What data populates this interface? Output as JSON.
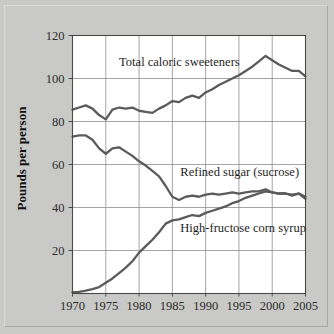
{
  "chart_data": {
    "type": "line",
    "title": "",
    "xlabel": "",
    "ylabel": "Pounds per person",
    "xlim": [
      1970,
      2005
    ],
    "ylim": [
      0,
      120
    ],
    "xticks": [
      1970,
      1975,
      1980,
      1985,
      1990,
      1995,
      2000,
      2005
    ],
    "xtick_labels": [
      "1970",
      "1975",
      "1980",
      "1985",
      "1990",
      "1995",
      "2000",
      "2005"
    ],
    "yticks": [
      20,
      40,
      60,
      80,
      100,
      120
    ],
    "ytick_labels": [
      "20",
      "40",
      "60",
      "80",
      "100",
      "120"
    ],
    "grid": true,
    "legend_position": "inline-annotations",
    "line_color": "#5b5b5b",
    "plot_background": "#ffffff",
    "figure_background": "#c9c9c7",
    "x": [
      1970,
      1971,
      1972,
      1973,
      1974,
      1975,
      1976,
      1977,
      1978,
      1979,
      1980,
      1981,
      1982,
      1983,
      1984,
      1985,
      1986,
      1987,
      1988,
      1989,
      1990,
      1991,
      1992,
      1993,
      1994,
      1995,
      1996,
      1997,
      1998,
      1999,
      2000,
      2001,
      2002,
      2003,
      2004,
      2005
    ],
    "series": [
      {
        "name": "Total caloric sweeteners",
        "label": "Total caloric sweeteners",
        "label_x": 1977.0,
        "label_y": 106.0,
        "values": [
          85.5,
          86.5,
          87.5,
          86.0,
          83.0,
          81.0,
          85.5,
          86.5,
          86.0,
          86.5,
          85.0,
          84.5,
          84.0,
          86.0,
          87.5,
          89.5,
          89.0,
          91.0,
          92.0,
          91.0,
          93.5,
          95.0,
          97.0,
          98.5,
          100.0,
          101.5,
          103.5,
          105.5,
          108.0,
          110.5,
          108.5,
          106.5,
          105.0,
          103.5,
          103.5,
          101.0
        ]
      },
      {
        "name": "Refined sugar (sucrose)",
        "label": "Refined sugar (sucrose)",
        "label_x": 1986.2,
        "label_y": 54.5,
        "values": [
          73.0,
          73.5,
          73.5,
          71.5,
          67.5,
          65.0,
          67.5,
          68.0,
          66.0,
          64.0,
          61.5,
          59.5,
          57.0,
          54.5,
          50.0,
          45.0,
          43.5,
          45.0,
          45.5,
          45.0,
          46.0,
          46.5,
          46.0,
          46.5,
          47.0,
          46.5,
          47.0,
          47.5,
          47.5,
          48.5,
          47.0,
          46.5,
          46.5,
          45.5,
          46.5,
          44.0
        ]
      },
      {
        "name": "High-fructose corn syrup",
        "label": "High-fructose corn syrup",
        "label_x": 1986.2,
        "label_y": 28.5,
        "values": [
          0.5,
          0.8,
          1.3,
          2.0,
          3.0,
          5.0,
          7.0,
          9.5,
          12.0,
          15.0,
          19.0,
          22.0,
          25.0,
          28.5,
          32.5,
          34.0,
          34.5,
          35.5,
          36.5,
          36.0,
          37.5,
          38.5,
          39.5,
          40.5,
          42.0,
          43.0,
          44.5,
          45.5,
          46.5,
          47.5,
          47.0,
          46.5,
          46.5,
          46.0,
          46.5,
          45.0
        ]
      }
    ]
  },
  "figure": {
    "name": "caloric-sweeteners-consumption-chart"
  }
}
